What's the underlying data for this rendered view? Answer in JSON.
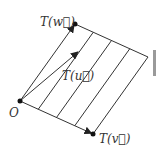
{
  "diagram": {
    "points": {
      "origin": {
        "label": "O",
        "x": 20,
        "y": 101
      },
      "Tw": {
        "label": "T(w)",
        "x": 75,
        "y": 24
      },
      "Tv": {
        "label": "T(v)",
        "x": 93,
        "y": 134
      },
      "far_corner": {
        "x": 148,
        "y": 57
      },
      "Tu_tip": {
        "x": 78,
        "y": 52
      }
    },
    "labels": {
      "origin": "O",
      "Tw": "T(w⃗)",
      "Tv": "T(v⃗)",
      "Tu": "T(u⃗)"
    },
    "interior_lines_count": 3,
    "colors": {
      "stroke": "#333333",
      "background": "#ffffff"
    }
  }
}
